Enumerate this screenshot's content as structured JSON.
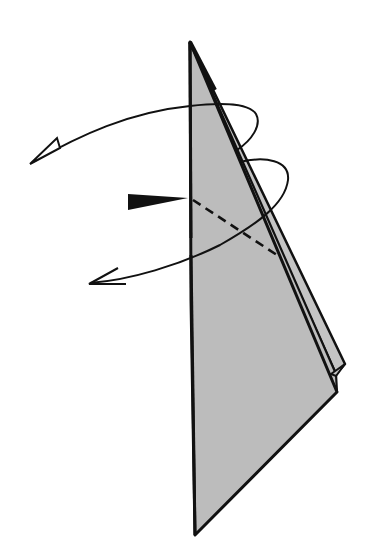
{
  "diagram": {
    "type": "origami-step",
    "colors": {
      "paper": "#bdbdbd",
      "paper_back": "#c4c4c4",
      "line": "#111111",
      "background": "#ffffff"
    },
    "elements": [
      {
        "name": "paper-front-flap",
        "shape": "triangle-kite"
      },
      {
        "name": "paper-back-layer",
        "shape": "narrow strip along right edge"
      },
      {
        "name": "fold-line-dashed",
        "style": "dashed",
        "meaning": "valley fold"
      },
      {
        "name": "push-arrow",
        "style": "solid black wedge",
        "meaning": "push / sink"
      },
      {
        "name": "turn-over-arrow-1",
        "style": "hollow head",
        "meaning": "fold behind / wrap"
      },
      {
        "name": "turn-over-arrow-2",
        "style": "open head",
        "meaning": "wrap around"
      }
    ]
  }
}
